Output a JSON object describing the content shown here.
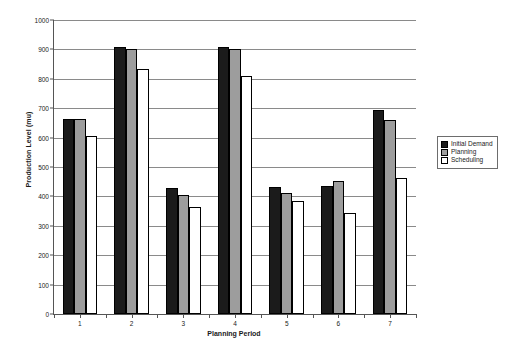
{
  "chart_data": {
    "type": "bar",
    "title": "",
    "xlabel": "Planning Period",
    "ylabel": "Production Level (mu)",
    "categories": [
      "1",
      "2",
      "3",
      "4",
      "5",
      "6",
      "7"
    ],
    "ylim": [
      0,
      1000
    ],
    "ytick_step": 100,
    "yticks": [
      "0",
      "100",
      "200",
      "300",
      "400",
      "500",
      "600",
      "700",
      "800",
      "900",
      "1000"
    ],
    "grid": true,
    "legend_position": "right",
    "series": [
      {
        "name": "Initial Demand",
        "color": "#1b1b1b",
        "values": [
          665,
          908,
          430,
          908,
          432,
          435,
          693
        ]
      },
      {
        "name": "Planning",
        "color": "#9d9d9d",
        "values": [
          665,
          900,
          405,
          903,
          413,
          452,
          660
        ]
      },
      {
        "name": "Scheduling",
        "color": "#ffffff",
        "values": [
          605,
          835,
          363,
          808,
          383,
          342,
          462
        ]
      }
    ]
  }
}
